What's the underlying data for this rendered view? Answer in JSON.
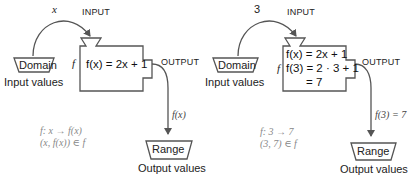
{
  "colors": {
    "stroke": "#555555",
    "text": "#222222",
    "note": "#888888"
  },
  "left_panel": {
    "input_symbol": "x",
    "input_caption": "INPUT",
    "output_caption": "OUTPUT",
    "machine_name": "f",
    "domain_label": "Domain",
    "domain_caption": "Input values",
    "equation_lines": [
      "f(x) = 2x + 1"
    ],
    "output_value": "f(x)",
    "range_label": "Range",
    "range_caption": "Output values",
    "notation": [
      "f:   x → f(x)",
      "(x, f(x)) ∈ f"
    ]
  },
  "right_panel": {
    "input_symbol": "3",
    "input_caption": "INPUT",
    "output_caption": "OUTPUT",
    "machine_name": "f",
    "domain_label": "Domain",
    "domain_caption": "Input values",
    "equation_lines": [
      "f(x) = 2x + 1",
      "f(3) = 2 · 3 + 1",
      "= 7"
    ],
    "output_value": "f(3) = 7",
    "range_label": "Range",
    "range_caption": "Output values",
    "notation": [
      "f:   3 → 7",
      "(3, 7) ∈ f"
    ]
  }
}
